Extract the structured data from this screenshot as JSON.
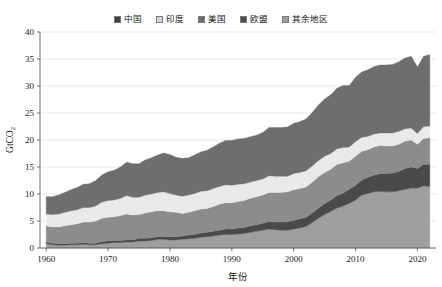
{
  "chart_data": {
    "type": "area",
    "stacked": true,
    "title": "",
    "xlabel": "年份",
    "ylabel": "GtCO₂",
    "ylabel_base": "GtCO",
    "ylabel_sub": "2",
    "xlim": [
      1959,
      2023
    ],
    "ylim": [
      0,
      40
    ],
    "yticks": [
      0,
      5,
      10,
      15,
      20,
      25,
      30,
      35,
      40
    ],
    "xticks": [
      1960,
      1970,
      1980,
      1990,
      2000,
      2010,
      2020
    ],
    "grid": "horizontal",
    "legend_position": "top-center",
    "x": [
      1960,
      1961,
      1962,
      1963,
      1964,
      1965,
      1966,
      1967,
      1968,
      1969,
      1970,
      1971,
      1972,
      1973,
      1974,
      1975,
      1976,
      1977,
      1978,
      1979,
      1980,
      1981,
      1982,
      1983,
      1984,
      1985,
      1986,
      1987,
      1988,
      1989,
      1990,
      1991,
      1992,
      1993,
      1994,
      1995,
      1996,
      1997,
      1998,
      1999,
      2000,
      2001,
      2002,
      2003,
      2004,
      2005,
      2006,
      2007,
      2008,
      2009,
      2010,
      2011,
      2012,
      2013,
      2014,
      2015,
      2016,
      2017,
      2018,
      2019,
      2020,
      2021,
      2022
    ],
    "stack_order_bottom_to_top": [
      "中国",
      "印度",
      "美国",
      "欧盟",
      "其余地区"
    ],
    "series": [
      {
        "name": "中国",
        "color": "#9e9e9e",
        "values": [
          0.8,
          0.6,
          0.5,
          0.5,
          0.6,
          0.6,
          0.7,
          0.6,
          0.6,
          0.8,
          0.9,
          1.0,
          1.0,
          1.1,
          1.1,
          1.3,
          1.3,
          1.4,
          1.6,
          1.6,
          1.5,
          1.5,
          1.6,
          1.7,
          1.8,
          2.0,
          2.1,
          2.2,
          2.4,
          2.5,
          2.5,
          2.6,
          2.7,
          2.9,
          3.1,
          3.3,
          3.5,
          3.4,
          3.3,
          3.3,
          3.5,
          3.7,
          4.0,
          4.7,
          5.5,
          6.2,
          6.8,
          7.4,
          7.8,
          8.3,
          8.9,
          9.8,
          10.1,
          10.4,
          10.5,
          10.4,
          10.4,
          10.6,
          10.9,
          11.1,
          11.1,
          11.5,
          11.4
        ]
      },
      {
        "name": "印度",
        "color": "#4a4a4a",
        "values": [
          0.3,
          0.3,
          0.3,
          0.3,
          0.3,
          0.3,
          0.3,
          0.3,
          0.3,
          0.4,
          0.4,
          0.4,
          0.4,
          0.4,
          0.4,
          0.5,
          0.5,
          0.5,
          0.5,
          0.5,
          0.6,
          0.6,
          0.6,
          0.7,
          0.7,
          0.8,
          0.8,
          0.9,
          0.9,
          1.0,
          1.0,
          1.1,
          1.1,
          1.2,
          1.2,
          1.3,
          1.4,
          1.4,
          1.5,
          1.6,
          1.6,
          1.7,
          1.7,
          1.8,
          1.9,
          2.0,
          2.1,
          2.3,
          2.4,
          2.6,
          2.7,
          2.8,
          3.0,
          3.1,
          3.3,
          3.4,
          3.5,
          3.6,
          3.8,
          3.9,
          3.6,
          4.0,
          4.1
        ]
      },
      {
        "name": "美国",
        "color": "#8c8c8c",
        "values": [
          3.0,
          3.0,
          3.1,
          3.3,
          3.4,
          3.6,
          3.8,
          3.9,
          4.1,
          4.3,
          4.4,
          4.4,
          4.6,
          4.8,
          4.6,
          4.4,
          4.7,
          4.8,
          4.8,
          4.8,
          4.6,
          4.5,
          4.2,
          4.2,
          4.4,
          4.4,
          4.4,
          4.6,
          4.8,
          4.9,
          4.9,
          4.9,
          5.0,
          5.1,
          5.2,
          5.2,
          5.4,
          5.5,
          5.5,
          5.5,
          5.7,
          5.6,
          5.6,
          5.7,
          5.8,
          5.8,
          5.7,
          5.8,
          5.6,
          5.2,
          5.4,
          5.3,
          5.1,
          5.2,
          5.2,
          5.1,
          5.0,
          5.0,
          5.1,
          5.0,
          4.5,
          4.8,
          4.9
        ]
      },
      {
        "name": "欧盟",
        "color": "#e9e9e9",
        "values": [
          2.2,
          2.3,
          2.4,
          2.5,
          2.6,
          2.6,
          2.7,
          2.7,
          2.8,
          3.0,
          3.1,
          3.1,
          3.2,
          3.4,
          3.3,
          3.2,
          3.3,
          3.3,
          3.4,
          3.5,
          3.4,
          3.2,
          3.2,
          3.2,
          3.2,
          3.3,
          3.3,
          3.3,
          3.3,
          3.3,
          3.2,
          3.2,
          3.1,
          3.0,
          3.0,
          3.0,
          3.1,
          3.0,
          3.0,
          2.9,
          3.0,
          3.0,
          3.0,
          3.0,
          3.0,
          3.0,
          2.9,
          2.9,
          2.8,
          2.6,
          2.7,
          2.6,
          2.5,
          2.4,
          2.3,
          2.4,
          2.4,
          2.4,
          2.3,
          2.2,
          2.0,
          2.2,
          2.2
        ]
      },
      {
        "name": "其余地区",
        "color": "#6e6e6e",
        "values": [
          3.2,
          3.3,
          3.5,
          3.7,
          3.9,
          4.1,
          4.3,
          4.4,
          4.7,
          5.0,
          5.3,
          5.5,
          5.8,
          6.2,
          6.2,
          6.2,
          6.5,
          6.7,
          6.9,
          7.2,
          7.2,
          7.0,
          7.0,
          6.9,
          7.1,
          7.3,
          7.5,
          7.7,
          8.0,
          8.2,
          8.3,
          8.4,
          8.4,
          8.4,
          8.4,
          8.6,
          8.9,
          9.0,
          9.0,
          9.1,
          9.3,
          9.4,
          9.6,
          9.9,
          10.3,
          10.6,
          10.9,
          11.2,
          11.5,
          11.4,
          11.9,
          12.1,
          12.3,
          12.5,
          12.6,
          12.6,
          12.7,
          12.9,
          13.1,
          13.3,
          12.3,
          13.0,
          13.2
        ]
      }
    ],
    "totals_note": "1960≈9.5, 1980≈17.3, 2000≈23.1, 2010≈31.6, 2019≈35.5, 2020≈33.5, 2022≈35.8"
  },
  "legend": {
    "items": [
      {
        "label": "中国",
        "color": "#3f3f3f"
      },
      {
        "label": "印度",
        "color": "#d5d5d5"
      },
      {
        "label": "美国",
        "color": "#6e6e6e"
      },
      {
        "label": "欧盟",
        "color": "#4a4a4a"
      },
      {
        "label": "其余地区",
        "color": "#9e9e9e"
      }
    ]
  },
  "axes": {
    "y_tick_labels": [
      "0",
      "5",
      "10",
      "15",
      "20",
      "25",
      "30",
      "35",
      "40"
    ],
    "x_tick_labels": [
      "1960",
      "1970",
      "1980",
      "1990",
      "2000",
      "2010",
      "2020"
    ],
    "y_axis_title": "GtCO",
    "y_axis_title_sub": "2",
    "x_axis_title": "年份"
  }
}
